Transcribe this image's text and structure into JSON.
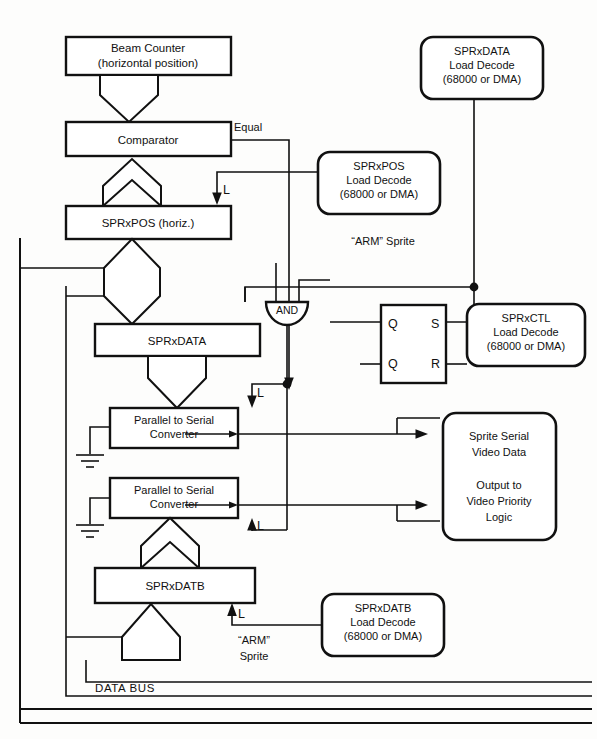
{
  "diagram": {
    "bus_label": "DATA BUS",
    "blocks": {
      "beam_counter": {
        "line1": "Beam Counter",
        "line2": "(horizontal position)"
      },
      "comparator": {
        "label": "Comparator"
      },
      "sprxpos": {
        "label": "SPRxPOS (horiz.)"
      },
      "sprxdata": {
        "label": "SPRxDATA"
      },
      "sprxdatb": {
        "label": "SPRxDATB"
      },
      "converter_a": {
        "line1": "Parallel to Serial",
        "line2": "Converter"
      },
      "converter_b": {
        "line1": "Parallel to Serial",
        "line2": "Converter"
      },
      "sprxpos_decode": {
        "line1": "SPRxPOS",
        "line2": "Load Decode",
        "line3": "(68000 or DMA)"
      },
      "sprxdata_decode": {
        "line1": "SPRxDATA",
        "line2": "Load Decode",
        "line3": "(68000 or DMA)"
      },
      "sprxctl_decode": {
        "line1": "SPRxCTL",
        "line2": "Load Decode",
        "line3": "(68000 or DMA)"
      },
      "sprxdatb_decode": {
        "line1": "SPRxDATB",
        "line2": "Load Decode",
        "line3": "(68000 or DMA)"
      },
      "video_output": {
        "line1": "Sprite Serial",
        "line2": "Video Data",
        "line3": "Output to",
        "line4": "Video Priority",
        "line5": "Logic"
      },
      "and_gate": {
        "label": "AND"
      },
      "flipflop": {
        "pin_q_top": "Q",
        "pin_s": "S",
        "pin_q_bottom": "Q",
        "pin_r": "R"
      }
    },
    "signals": {
      "equal": "Equal",
      "arm_sprite_top": "“ARM” Sprite",
      "arm_sprite_bottom_l1": "“ARM”",
      "arm_sprite_bottom_l2": "Sprite",
      "load_pos": "L",
      "load_data": "L",
      "load_conv_a": "L",
      "load_conv_b": "L",
      "load_datb": "L"
    },
    "colors": {
      "ink": "#111111",
      "paper": "#fdfdfc"
    }
  }
}
